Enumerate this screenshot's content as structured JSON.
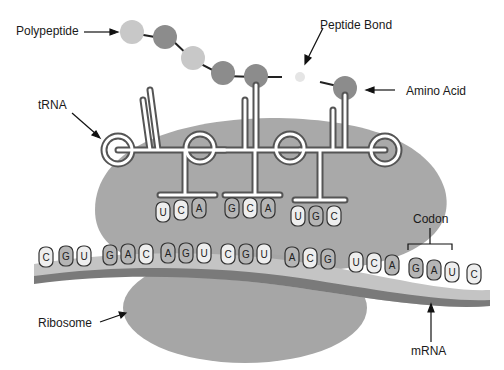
{
  "labels": {
    "polypeptide": "Polypeptide",
    "peptide_bond": "Peptide Bond",
    "amino_acid": "Amino Acid",
    "trna": "tRNA",
    "codon": "Codon",
    "ribosome": "Ribosome",
    "mrna": "mRNA"
  },
  "mrna_bases": [
    "C",
    "G",
    "U",
    "G",
    "A",
    "C",
    "A",
    "G",
    "U",
    "C",
    "G",
    "U",
    "A",
    "C",
    "G",
    "U",
    "C",
    "A",
    "G",
    "A",
    "U",
    "C"
  ],
  "trna_anticodons": [
    {
      "bases": [
        "U",
        "C",
        "A"
      ],
      "pairs_with": [
        "A",
        "G",
        "U"
      ]
    },
    {
      "bases": [
        "G",
        "C",
        "A"
      ],
      "pairs_with": [
        "C",
        "G",
        "U"
      ]
    },
    {
      "bases": [
        "U",
        "G",
        "C"
      ],
      "pairs_with": [
        "A",
        "C",
        "G"
      ]
    }
  ],
  "highlighted_codon": [
    "G",
    "A",
    "U"
  ],
  "colors": {
    "ribosome": "#a9a9a9",
    "mrna_light": "#c4c4c4",
    "mrna_dark": "#7a7a7a",
    "bead_light": "#c8c8c8",
    "bead_dark": "#8c8c8c"
  }
}
